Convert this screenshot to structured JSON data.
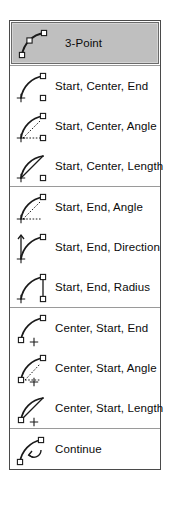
{
  "menu": {
    "name": "arc-tool-flyout-menu",
    "colors": {
      "border": "#4a4a4a",
      "separator": "#9a9a9a",
      "background": "#ffffff",
      "selected_background": "#bfbfbf",
      "selected_border": "#6b6b6b",
      "text": "#0b0b0b",
      "icon_stroke": "#1a1a1a"
    },
    "sections": [
      {
        "items": [
          {
            "label": "3-Point",
            "icon": "arc-3point-icon",
            "selected": true
          }
        ]
      },
      {
        "items": [
          {
            "label": "Start, Center, End",
            "icon": "arc-start-center-end-icon",
            "selected": false
          },
          {
            "label": "Start, Center, Angle",
            "icon": "arc-start-center-angle-icon",
            "selected": false
          },
          {
            "label": "Start, Center, Length",
            "icon": "arc-start-center-length-icon",
            "selected": false
          }
        ]
      },
      {
        "items": [
          {
            "label": "Start, End, Angle",
            "icon": "arc-start-end-angle-icon",
            "selected": false
          },
          {
            "label": "Start, End, Direction",
            "icon": "arc-start-end-direction-icon",
            "selected": false
          },
          {
            "label": "Start, End, Radius",
            "icon": "arc-start-end-radius-icon",
            "selected": false
          }
        ]
      },
      {
        "items": [
          {
            "label": "Center, Start, End",
            "icon": "arc-center-start-end-icon",
            "selected": false
          },
          {
            "label": "Center, Start, Angle",
            "icon": "arc-center-start-angle-icon",
            "selected": false
          },
          {
            "label": "Center, Start, Length",
            "icon": "arc-center-start-length-icon",
            "selected": false
          }
        ]
      },
      {
        "items": [
          {
            "label": "Continue",
            "icon": "arc-continue-icon",
            "selected": false
          }
        ]
      }
    ]
  }
}
